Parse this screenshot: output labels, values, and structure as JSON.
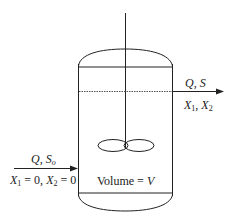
{
  "diagram": {
    "type": "continuous stirred tank reactor",
    "inlet": {
      "top_label": [
        "Q",
        ", ",
        "S",
        "o"
      ],
      "bottom_label": [
        "X",
        "1",
        " = 0, ",
        "X",
        "2",
        " = 0"
      ]
    },
    "outlet": {
      "top_label": [
        "Q",
        ", ",
        "S"
      ],
      "bottom_label": [
        "X",
        "1",
        ", ",
        "X",
        "2"
      ]
    },
    "volume_label": [
      "Volume = ",
      "V"
    ],
    "colors": {
      "line": "#222222",
      "background": "#ffffff"
    }
  }
}
